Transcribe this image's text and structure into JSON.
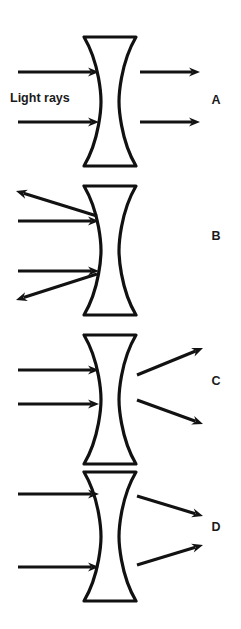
{
  "figure": {
    "background_color": "#ffffff",
    "ink_color": "#121212",
    "caption": {
      "label": "Light rays",
      "x": 10,
      "y": 102
    },
    "lens": {
      "type": "biconcave-diverging",
      "cap_left_x": 84,
      "cap_right_x": 136,
      "waist_left_x": 101,
      "waist_right_x": 119,
      "width": 52,
      "height": 129,
      "stroke_color": "#111111",
      "fill_color": "#ffffff"
    },
    "panels": [
      {
        "id": "A",
        "label": "A",
        "label_x": 216,
        "label_y": 104,
        "lens_top_y": 37,
        "lens_bottom_y": 166,
        "description": "Parallel rays enter and exit parallel (undeviated)",
        "incoming_rays": [
          {
            "x1": 18,
            "y1": 72,
            "x2": 99,
            "y2": 72
          },
          {
            "x1": 18,
            "y1": 122,
            "x2": 99,
            "y2": 122
          }
        ],
        "outgoing_rays": [
          {
            "x1": 140,
            "y1": 72,
            "x2": 200,
            "y2": 72
          },
          {
            "x1": 140,
            "y1": 122,
            "x2": 200,
            "y2": 122
          }
        ]
      },
      {
        "id": "B",
        "label": "B",
        "label_x": 216,
        "label_y": 240,
        "lens_top_y": 186,
        "lens_bottom_y": 315,
        "description": "Rays reflect back from the lens toward the upper-left and lower-left",
        "incoming_rays": [
          {
            "x1": 18,
            "y1": 221,
            "x2": 99,
            "y2": 221
          },
          {
            "x1": 18,
            "y1": 271,
            "x2": 99,
            "y2": 271
          }
        ],
        "outgoing_rays": [
          {
            "x1": 97,
            "y1": 216,
            "x2": 16,
            "y2": 191
          },
          {
            "x1": 97,
            "y1": 274,
            "x2": 16,
            "y2": 300
          }
        ]
      },
      {
        "id": "C",
        "label": "C",
        "label_x": 216,
        "label_y": 385,
        "lens_top_y": 335,
        "lens_bottom_y": 464,
        "description": "Rays diverge after passing through the lens",
        "incoming_rays": [
          {
            "x1": 18,
            "y1": 370,
            "x2": 99,
            "y2": 370
          },
          {
            "x1": 18,
            "y1": 404,
            "x2": 99,
            "y2": 404
          }
        ],
        "outgoing_rays": [
          {
            "x1": 137,
            "y1": 375,
            "x2": 203,
            "y2": 348
          },
          {
            "x1": 137,
            "y1": 400,
            "x2": 203,
            "y2": 424
          }
        ]
      },
      {
        "id": "D",
        "label": "D",
        "label_x": 216,
        "label_y": 531,
        "lens_top_y": 472,
        "lens_bottom_y": 601,
        "description": "Rays converge toward a point after the lens",
        "incoming_rays": [
          {
            "x1": 18,
            "y1": 494,
            "x2": 99,
            "y2": 494
          },
          {
            "x1": 18,
            "y1": 567,
            "x2": 99,
            "y2": 567
          }
        ],
        "outgoing_rays": [
          {
            "x1": 137,
            "y1": 496,
            "x2": 203,
            "y2": 516
          },
          {
            "x1": 137,
            "y1": 565,
            "x2": 203,
            "y2": 545
          }
        ]
      }
    ]
  }
}
